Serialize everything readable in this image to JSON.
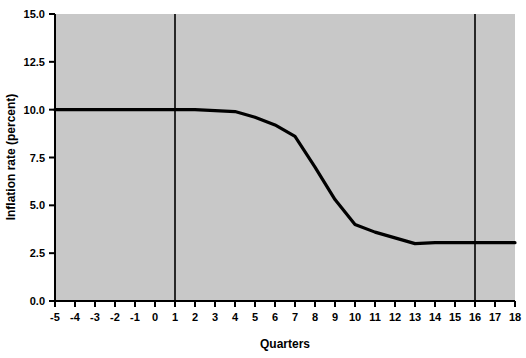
{
  "chart_data": {
    "type": "line",
    "title": "",
    "xlabel": "Quarters",
    "ylabel": "Inflation rate (percent)",
    "xlim": [
      -5,
      18
    ],
    "ylim": [
      0.0,
      15.0
    ],
    "grid": false,
    "legend": "none",
    "plot_background": "#c8c8c8",
    "line_color": "#000000",
    "xticks": [
      "-5",
      "-4",
      "-3",
      "-2",
      "-1",
      "0",
      "1",
      "2",
      "3",
      "4",
      "5",
      "6",
      "7",
      "8",
      "9",
      "10",
      "11",
      "12",
      "13",
      "14",
      "15",
      "16",
      "17",
      "18"
    ],
    "yticks": [
      "0.0",
      "2.5",
      "5.0",
      "7.5",
      "10.0",
      "12.5",
      "15.0"
    ],
    "x": [
      -5,
      -4,
      -3,
      -2,
      -1,
      0,
      1,
      2,
      3,
      4,
      5,
      6,
      7,
      8,
      9,
      10,
      11,
      12,
      13,
      14,
      15,
      16,
      17,
      18
    ],
    "series": [
      {
        "name": "Inflation rate",
        "values": [
          10.0,
          10.0,
          10.0,
          10.0,
          10.0,
          10.0,
          10.0,
          10.0,
          9.95,
          9.9,
          9.6,
          9.2,
          8.6,
          7.0,
          5.3,
          4.0,
          3.6,
          3.3,
          3.0,
          3.05,
          3.05,
          3.05,
          3.05,
          3.05
        ]
      }
    ],
    "annotations": [
      {
        "name": "vertical-line-q1",
        "type": "vline",
        "x": 1,
        "color": "#000000"
      },
      {
        "name": "vertical-line-q16",
        "type": "vline",
        "x": 16,
        "color": "#000000"
      }
    ]
  }
}
